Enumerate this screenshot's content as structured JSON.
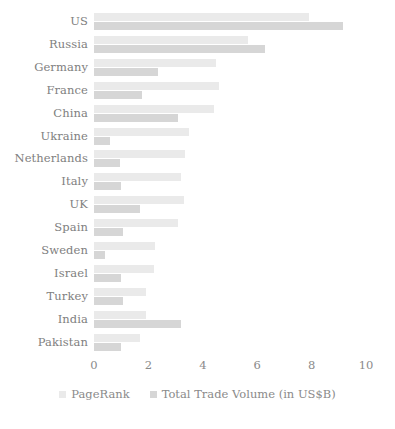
{
  "chart_data": {
    "type": "bar",
    "orientation": "horizontal",
    "title": "",
    "xlabel": "",
    "ylabel": "",
    "xlim": [
      0,
      10
    ],
    "xticks": [
      0,
      2,
      4,
      6,
      8,
      10
    ],
    "xtick_labels": [
      "0",
      "2",
      "4",
      "6",
      "8",
      "10"
    ],
    "grid": false,
    "legend_position": "bottom",
    "categories": [
      "US",
      "Russia",
      "Germany",
      "France",
      "China",
      "Ukraine",
      "Netherlands",
      "Italy",
      "UK",
      "Spain",
      "Sweden",
      "Israel",
      "Turkey",
      "India",
      "Pakistan"
    ],
    "series": [
      {
        "name": "PageRank",
        "color": "#eaeaea",
        "values": [
          7.9,
          5.65,
          4.5,
          4.6,
          4.4,
          3.5,
          3.35,
          3.2,
          3.3,
          3.1,
          2.25,
          2.2,
          1.9,
          1.9,
          1.7
        ]
      },
      {
        "name": "Total Trade Volume (in US$B)",
        "color": "#d6d6d6",
        "values": [
          9.15,
          6.3,
          2.35,
          1.75,
          3.1,
          0.6,
          0.95,
          1.0,
          1.7,
          1.05,
          0.4,
          1.0,
          1.05,
          3.2,
          1.0
        ]
      }
    ]
  },
  "legend": {
    "items": [
      {
        "label": "PageRank",
        "swatch": "pagerank"
      },
      {
        "label": "Total Trade Volume (in US$B)",
        "swatch": "trade"
      }
    ]
  }
}
